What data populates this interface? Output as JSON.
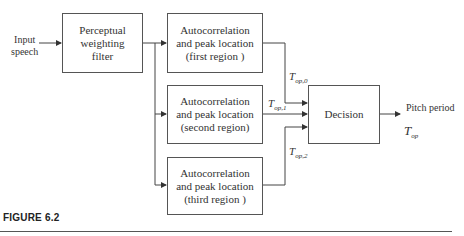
{
  "input": {
    "line1": "Input",
    "line2": "speech"
  },
  "blocks": {
    "perceptual": [
      "Perceptual",
      "weighting",
      "filter"
    ],
    "autocorr1": [
      "Autocorrelation",
      "and peak location",
      "(first region )"
    ],
    "autocorr2": [
      "Autocorrelation",
      "and peak location",
      "(second region)"
    ],
    "autocorr3": [
      "Autocorrelation",
      "and peak location",
      "(third region )"
    ],
    "decision": "Decision"
  },
  "signals": {
    "t0": {
      "base": "T",
      "sub": "op,0"
    },
    "t1": {
      "base": "T",
      "sub": "op,1"
    },
    "t2": {
      "base": "T",
      "sub": "op,2"
    },
    "out": {
      "base": "T",
      "sub": "op"
    }
  },
  "output_label": "Pitch period",
  "caption": "FIGURE 6.2"
}
